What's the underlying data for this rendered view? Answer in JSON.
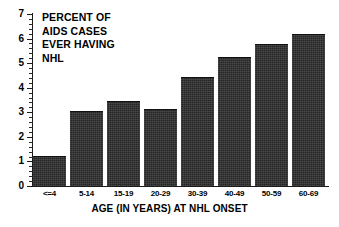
{
  "chart_data": {
    "type": "bar",
    "title": "PERCENT OF AIDS CASES EVER HAVING NHL",
    "title_lines": [
      "PERCENT OF",
      "AIDS CASES",
      "EVER HAVING",
      "NHL"
    ],
    "xlabel": "AGE (IN YEARS) AT NHL ONSET",
    "ylabel": "",
    "categories": [
      "<=4",
      "5-14",
      "15-19",
      "20-29",
      "30-39",
      "40-49",
      "50-59",
      "60-69"
    ],
    "values": [
      1.2,
      3.0,
      3.4,
      3.1,
      4.4,
      5.2,
      5.75,
      6.15
    ],
    "ylim": [
      0,
      7
    ],
    "ytick_labels": [
      "0",
      "1",
      "2",
      "3",
      "4",
      "5",
      "6",
      "7"
    ],
    "ytick_values": [
      0,
      1,
      2,
      3,
      4,
      5,
      6,
      7
    ],
    "y_minor_step": 0.2,
    "grid": false,
    "legend": false,
    "legend_position": "none",
    "bar_color": "#2e2e2e",
    "axis_color": "#1a1a1a",
    "background_color": "#ffffff"
  }
}
